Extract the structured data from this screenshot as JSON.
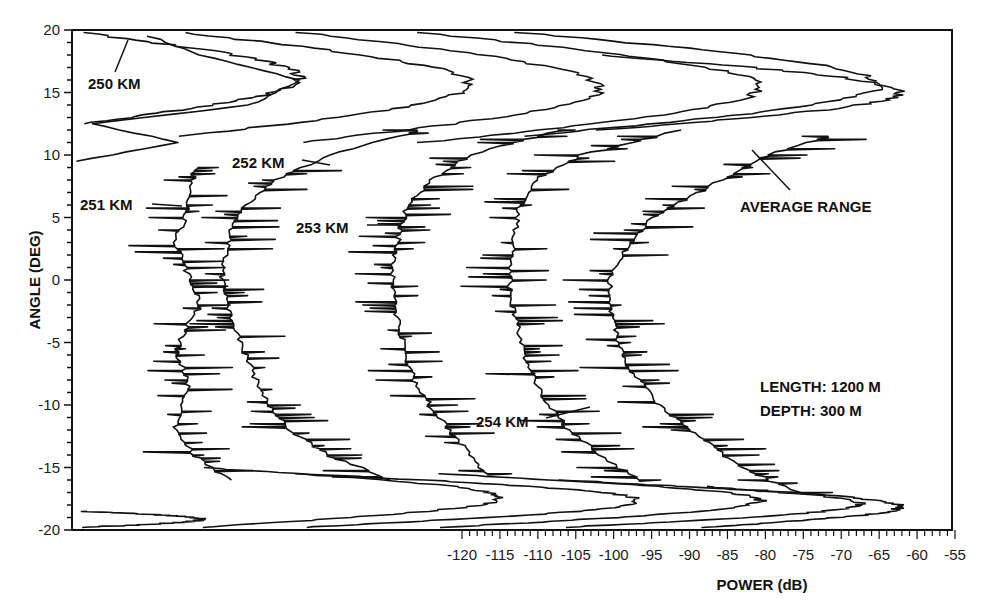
{
  "chart_data": {
    "type": "line",
    "title": "",
    "xlabel": "POWER (dB)",
    "ylabel": "ANGLE (DEG)",
    "xlim": [
      -120,
      -55
    ],
    "ylim": [
      -20,
      20
    ],
    "x_ticks": [
      -120,
      -115,
      -110,
      -105,
      -100,
      -95,
      -90,
      -85,
      -80,
      -75,
      -70,
      -65,
      -60,
      -55
    ],
    "x_tick_labels": [
      "-120",
      "-115",
      "-110",
      "-105",
      "-100",
      "-95",
      "-90",
      "-85",
      "-80",
      "-75",
      "-70",
      "-65",
      "-60",
      "-55"
    ],
    "y_ticks": [
      20,
      15,
      10,
      5,
      0,
      -5,
      -10,
      -15,
      -20
    ],
    "y_tick_labels": [
      "20",
      "15",
      "10",
      "5",
      "0",
      "-5",
      "-10",
      "-15",
      "-20"
    ],
    "grid": false,
    "layout": "waterfall (each range curve horizontally offset); dB scale applies to AVERAGE RANGE curve",
    "series": [
      {
        "name": "250 KM",
        "note": "top-most and bottom-most offset traces",
        "angles": [
          19.5,
          18,
          16,
          14,
          12.5,
          11,
          9.5
        ],
        "pixel_x": [
          150,
          200,
          300,
          250,
          90,
          180,
          75
        ]
      },
      {
        "name": "251 KM",
        "angles": [
          9,
          7,
          5,
          3,
          1,
          0,
          -2,
          -4,
          -6,
          -8,
          -10,
          -12,
          -14,
          -16
        ],
        "pixel_x": [
          195,
          190,
          185,
          175,
          185,
          190,
          200,
          185,
          175,
          190,
          180,
          175,
          195,
          230
        ]
      },
      {
        "name": "252 KM",
        "angles": [
          12,
          10,
          8,
          6,
          4,
          2,
          0,
          -2,
          -4,
          -6,
          -8,
          -10,
          -12,
          -14,
          -16
        ],
        "pixel_x": [
          420,
          330,
          275,
          245,
          232,
          225,
          222,
          228,
          236,
          246,
          256,
          268,
          290,
          330,
          390
        ]
      },
      {
        "name": "253 KM",
        "angles": [
          12,
          10,
          8,
          6,
          4,
          2,
          0,
          -2,
          -4,
          -6,
          -8,
          -10,
          -12,
          -14,
          -15.5
        ],
        "pixel_x": [
          560,
          470,
          430,
          408,
          400,
          395,
          392,
          395,
          400,
          406,
          415,
          430,
          450,
          470,
          485
        ]
      },
      {
        "name": "254 KM",
        "angles": [
          12,
          10,
          8,
          6,
          4,
          2,
          0,
          -2,
          -4,
          -6,
          -8,
          -10,
          -12,
          -14,
          -16
        ],
        "pixel_x": [
          680,
          580,
          535,
          520,
          515,
          512,
          510,
          512,
          518,
          525,
          535,
          548,
          570,
          600,
          640
        ]
      },
      {
        "name": "AVERAGE RANGE",
        "angles": [
          11.5,
          10,
          8,
          6,
          5,
          2,
          0,
          -2,
          -5,
          -7,
          -10,
          -12,
          -15,
          -17
        ],
        "values_db": [
          -71.5,
          -80,
          -86,
          -92,
          -95,
          -99,
          -100.5,
          -100.5,
          -99.5,
          -98,
          -94,
          -90,
          -83,
          -75.5
        ]
      }
    ],
    "annotations": [
      {
        "text": "250 KM",
        "x_px": 88,
        "y_px": 88
      },
      {
        "text": "251 KM",
        "x_px": 80,
        "y_px": 210
      },
      {
        "text": "252 KM",
        "x_px": 232,
        "y_px": 168
      },
      {
        "text": "253 KM",
        "x_px": 296,
        "y_px": 232
      },
      {
        "text": "254 KM",
        "x_px": 476,
        "y_px": 428
      },
      {
        "text": "AVERAGE RANGE",
        "x_px": 740,
        "y_px": 212
      },
      {
        "text": "LENGTH: 1200 M",
        "x_px": 760,
        "y_px": 392
      },
      {
        "text": "DEPTH: 300 M",
        "x_px": 760,
        "y_px": 416
      }
    ]
  },
  "labels": {
    "xlabel": "POWER (dB)",
    "ylabel": "ANGLE (DEG)",
    "r250": "250 KM",
    "r251": "251 KM",
    "r252": "252 KM",
    "r253": "253 KM",
    "r254": "254 KM",
    "avg": "AVERAGE RANGE",
    "length": "LENGTH: 1200 M",
    "depth": "DEPTH: 300 M"
  },
  "colors": {
    "ink": "#111111",
    "background": "#ffffff"
  }
}
